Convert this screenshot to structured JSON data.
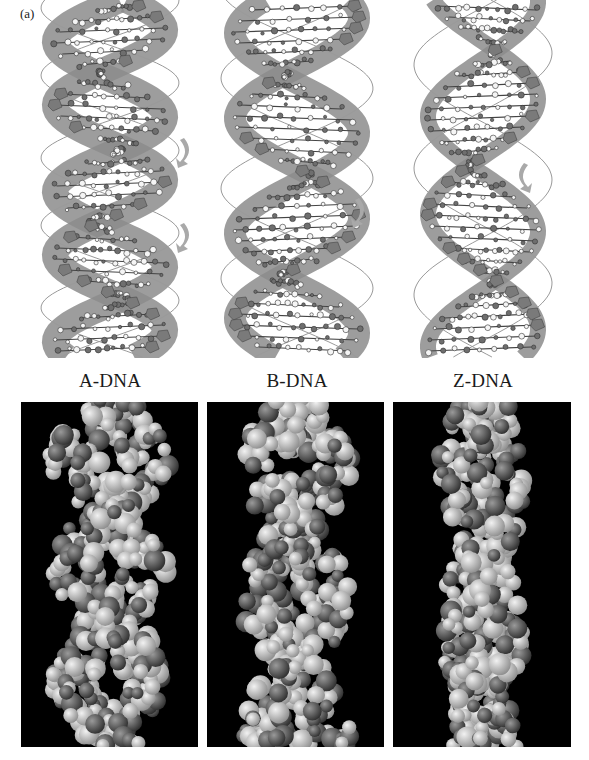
{
  "figure": {
    "panel_label": "(a)",
    "forms": [
      {
        "id": "a",
        "caption": "A-DNA",
        "twist": "right-handed",
        "groove_color": "#8a8a8a"
      },
      {
        "id": "b",
        "caption": "B-DNA",
        "twist": "right-handed",
        "groove_color": "#8a8a8a"
      },
      {
        "id": "z",
        "caption": "Z-DNA",
        "twist": "left-handed",
        "groove_color": "#8a8a8a"
      }
    ],
    "colors": {
      "background": "#ffffff",
      "ribbon": "#8c8c8c",
      "atom_dark": "#6e6e6e",
      "atom_light": "#f5f5f5",
      "backbone_line": "#9a9a9a",
      "model_bg": "#000000",
      "sphere_light": "#cfcfcf",
      "sphere_dark": "#5a5a5a"
    }
  }
}
